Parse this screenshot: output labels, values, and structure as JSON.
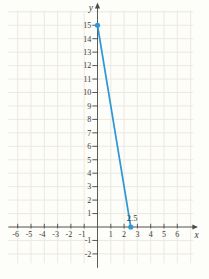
{
  "figure": {
    "width": 209,
    "height": 279,
    "background": "#fdfdfa"
  },
  "chart_data": {
    "type": "line",
    "title": "",
    "xlabel": "x",
    "ylabel": "y",
    "xlim": [
      -6.7,
      7.2
    ],
    "ylim": [
      -2.7,
      16.1
    ],
    "grid": true,
    "legend": false,
    "grid_color": "#ece9e0",
    "axis_color": "#4a4a48",
    "text_color": "#3e3c38",
    "x_gridlines": [
      -6,
      -5,
      -4,
      -3,
      -2,
      -1,
      0,
      1,
      2,
      3,
      4,
      5,
      6,
      7
    ],
    "y_gridlines": [
      -2,
      -1,
      0,
      1,
      2,
      3,
      4,
      5,
      6,
      7,
      8,
      9,
      10,
      11,
      12,
      13,
      14,
      15,
      16
    ],
    "x_tick_labels": [
      -6,
      -5,
      -4,
      -3,
      -2,
      -1,
      1,
      2,
      3,
      4,
      5,
      6
    ],
    "y_tick_labels": [
      -2,
      -1,
      1,
      2,
      3,
      4,
      5,
      6,
      7,
      8,
      9,
      10,
      11,
      12,
      13,
      14,
      15
    ],
    "series": [
      {
        "name": "line-segment",
        "color": "#2f97d4",
        "points": [
          [
            0,
            15
          ],
          [
            2.5,
            0
          ]
        ],
        "markers": true
      }
    ],
    "annotations": [
      {
        "text": "2.5",
        "x": 2.2,
        "y": 0.45,
        "anchor": "start"
      }
    ]
  }
}
